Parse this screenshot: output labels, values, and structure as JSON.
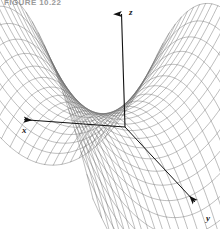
{
  "figure": {
    "caption": "FIGURE 10.22",
    "caption_color": "#9a9a9a",
    "background_color": "#ffffff"
  },
  "axes": {
    "x": {
      "label": "x",
      "label_x": 22,
      "label_y": 133,
      "arrow_tip_x": 16,
      "arrow_tip_y": 119,
      "origin_x": 125,
      "origin_y": 127,
      "color": "#111111"
    },
    "y": {
      "label": "y",
      "label_x": 206,
      "label_y": 221,
      "arrow_tip_x": 201,
      "arrow_tip_y": 207,
      "origin_x": 125,
      "origin_y": 127,
      "color": "#111111"
    },
    "z": {
      "label": "z",
      "label_x": 129,
      "label_y": 15,
      "arrow_tip_x": 121,
      "arrow_tip_y": 9,
      "origin_x": 125,
      "origin_y": 127,
      "color": "#111111"
    }
  },
  "chart_data": {
    "type": "surface",
    "title": "FIGURE 10.22",
    "surface_name": "hyperbolic-paraboloid-saddle",
    "equation": "z = x^2 - y^2",
    "xlabel": "x",
    "ylabel": "y",
    "zlabel": "z",
    "grid": true,
    "legend": "none",
    "mesh": {
      "u_lines": 26,
      "v_lines": 26,
      "line_color": "#6d6d6d",
      "line_width": 0.45,
      "fill": "none"
    },
    "domain": {
      "u": [
        -1,
        1
      ],
      "v": [
        -1,
        1
      ]
    },
    "projection": {
      "origin_px": [
        125,
        127
      ],
      "x_axis_px": [
        -108,
        -8
      ],
      "y_axis_px": [
        76,
        80
      ],
      "z_axis_px": [
        0,
        -118
      ]
    },
    "surface_extent_px": {
      "left": 10,
      "right": 213,
      "top": 47,
      "bottom": 190
    }
  }
}
